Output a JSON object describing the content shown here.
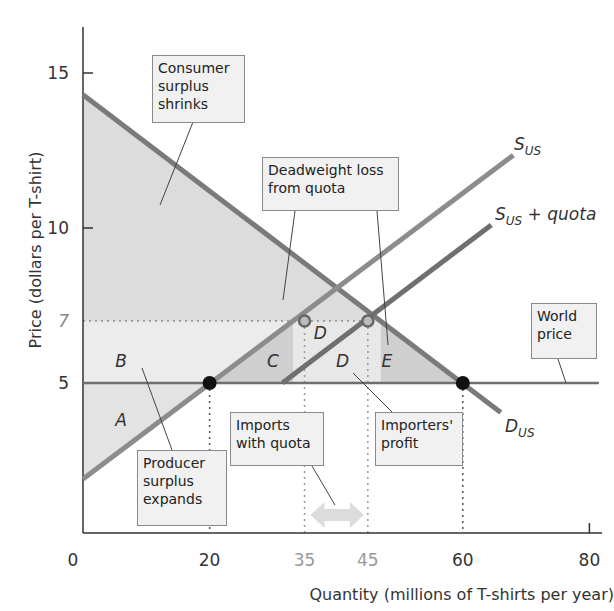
{
  "chart_data": {
    "type": "line",
    "title": "",
    "xlabel": "Quantity (millions of T-shirts per year)",
    "ylabel": "Price (dollars per T-shirt)",
    "xlim": [
      0,
      80
    ],
    "ylim": [
      0,
      16
    ],
    "x_ticks": [
      {
        "value": 0,
        "label": "0",
        "muted": false
      },
      {
        "value": 20,
        "label": "20",
        "muted": false
      },
      {
        "value": 35,
        "label": "35",
        "muted": true
      },
      {
        "value": 45,
        "label": "45",
        "muted": true
      },
      {
        "value": 60,
        "label": "60",
        "muted": false
      },
      {
        "value": 80,
        "label": "80",
        "muted": false
      }
    ],
    "y_ticks": [
      {
        "value": 5,
        "label": "5",
        "muted": false
      },
      {
        "value": 7,
        "label": "7",
        "muted": true
      },
      {
        "value": 10,
        "label": "10",
        "muted": false
      },
      {
        "value": 15,
        "label": "15",
        "muted": false
      }
    ],
    "series": [
      {
        "name": "D_US",
        "label_main": "D",
        "label_sub": "US",
        "label_suffix": "",
        "points": [
          [
            0,
            14.3
          ],
          [
            66,
            4.05
          ]
        ],
        "color": "#7a7a7a"
      },
      {
        "name": "S_US",
        "label_main": "S",
        "label_sub": "US",
        "label_suffix": "",
        "points": [
          [
            0,
            1.9
          ],
          [
            68,
            12.35
          ]
        ],
        "color": "#8c8c8c"
      },
      {
        "name": "S_US + quota",
        "label_main": "S",
        "label_sub": "US",
        "label_suffix": " + quota",
        "points": [
          [
            31.5,
            5
          ],
          [
            64.5,
            10.1
          ]
        ],
        "color": "#6f6f6f"
      },
      {
        "name": "World price",
        "label_main": "",
        "label_sub": "",
        "label_suffix": "",
        "points": [
          [
            0,
            5
          ],
          [
            82,
            5
          ]
        ],
        "color": "#6f6f6f"
      }
    ],
    "points": [
      {
        "name": "domestic-production-world",
        "x": 20,
        "y": 5,
        "style": "filled"
      },
      {
        "name": "domestic-consumption-world",
        "x": 60,
        "y": 5,
        "style": "filled"
      },
      {
        "name": "domestic-production-quota",
        "x": 35,
        "y": 7,
        "style": "hollow"
      },
      {
        "name": "domestic-consumption-quota",
        "x": 45,
        "y": 7,
        "style": "hollow"
      }
    ],
    "guides": {
      "price_with_quota": 7,
      "vertical_at": [
        20,
        35,
        45,
        60
      ]
    },
    "areas": [
      {
        "name": "A",
        "label": "A",
        "at": [
          6,
          3.8
        ]
      },
      {
        "name": "B",
        "label": "B",
        "at": [
          6,
          5.7
        ]
      },
      {
        "name": "C",
        "label": "C",
        "at": [
          30,
          5.7
        ]
      },
      {
        "name": "D-upper",
        "label": "D",
        "at": [
          37.5,
          6.6
        ]
      },
      {
        "name": "D-lower",
        "label": "D",
        "at": [
          41,
          5.7
        ]
      },
      {
        "name": "E",
        "label": "E",
        "at": [
          48,
          5.7
        ]
      }
    ],
    "annotations": [
      {
        "name": "consumer-surplus-note",
        "lines": [
          "Consumer",
          "surplus",
          "shrinks"
        ]
      },
      {
        "name": "deadweight-loss-note",
        "lines": [
          "Deadweight loss",
          "from quota"
        ]
      },
      {
        "name": "world-price-note",
        "lines": [
          "World",
          "price"
        ]
      },
      {
        "name": "producer-surplus-note",
        "lines": [
          "Producer",
          "surplus",
          "expands"
        ]
      },
      {
        "name": "imports-note",
        "lines": [
          "Imports",
          "with quota"
        ]
      },
      {
        "name": "importers-profit-note",
        "lines": [
          "Importers'",
          "profit"
        ]
      }
    ],
    "imports_range": [
      35,
      45
    ],
    "grid": false,
    "legend": "none"
  }
}
